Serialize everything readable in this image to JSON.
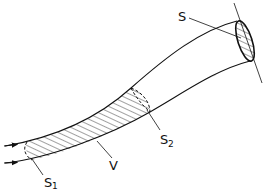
{
  "figure": {
    "type": "stream-tube",
    "colors": {
      "stroke": "#111111",
      "background": "#ffffff"
    }
  },
  "labels": {
    "S": {
      "main": "S",
      "sub": ""
    },
    "S1": {
      "main": "S",
      "sub": "1"
    },
    "S2": {
      "main": "S",
      "sub": "2"
    },
    "V": {
      "main": "V",
      "sub": ""
    }
  }
}
